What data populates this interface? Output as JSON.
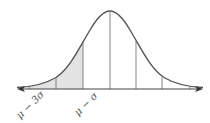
{
  "diagram": {
    "type": "normal-distribution-curve",
    "shaded_region": {
      "from": "μ − 3σ",
      "to": "μ − σ"
    },
    "colors": {
      "curve": "#555555",
      "axis": "#444444",
      "shade": "#e3e3e3",
      "lines": "#777777"
    },
    "labels": {
      "mu_minus_3sigma": "μ − 3σ",
      "mu_minus_sigma": "μ − σ"
    }
  }
}
